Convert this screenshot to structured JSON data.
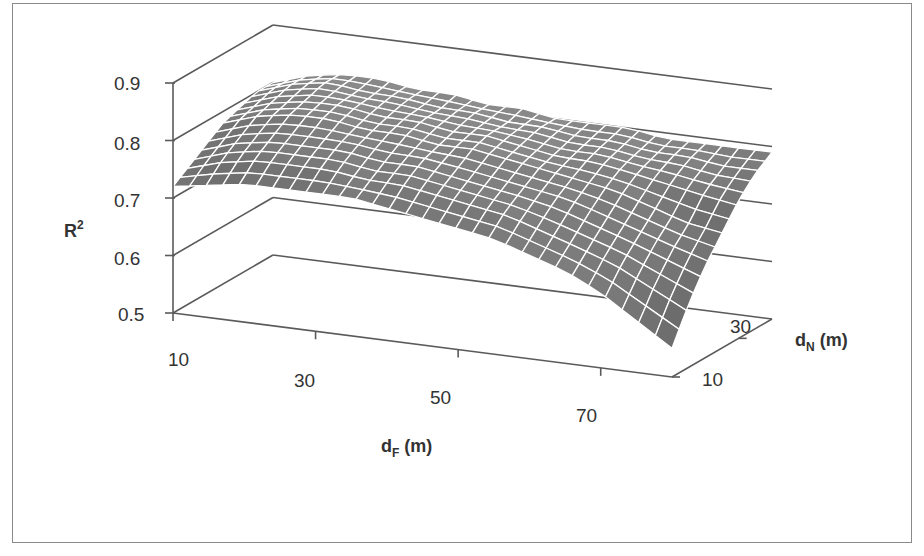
{
  "chart_data": {
    "type": "surface3d",
    "title": "",
    "xlabel": "d_F (m)",
    "xlabel_main": "d",
    "xlabel_sub": "F",
    "xlabel_unit": " (m)",
    "ylabel": "d_N (m)",
    "ylabel_main": "d",
    "ylabel_sub": "N",
    "ylabel_unit": " (m)",
    "zlabel": "R^2",
    "zlabel_main": "R",
    "zlabel_sup": "2",
    "x_ticks": [
      "10",
      "30",
      "50",
      "70"
    ],
    "y_ticks": [
      "10",
      "30"
    ],
    "z_ticks": [
      "0.5",
      "0.6",
      "0.7",
      "0.8",
      "0.9"
    ],
    "xlim": [
      10,
      80
    ],
    "ylim": [
      10,
      40
    ],
    "zlim": [
      0.5,
      0.9
    ],
    "x": [
      10,
      15,
      20,
      25,
      30,
      35,
      40,
      45,
      50,
      55,
      60,
      65,
      70,
      75,
      80
    ],
    "y": [
      10,
      15,
      20,
      25,
      30,
      35,
      40
    ],
    "z_note": "Approximate R^2 surface: peaks ~0.83 near low d_F / high d_N, ~0.72 along low d_F front edge, falls to ~0.55 at high d_F / low d_N.",
    "z": [
      [
        0.72,
        0.73,
        0.74,
        0.74,
        0.74,
        0.74,
        0.73,
        0.72,
        0.71,
        0.7,
        0.68,
        0.66,
        0.63,
        0.59,
        0.55
      ],
      [
        0.74,
        0.76,
        0.77,
        0.77,
        0.77,
        0.76,
        0.76,
        0.75,
        0.74,
        0.73,
        0.71,
        0.69,
        0.67,
        0.64,
        0.61
      ],
      [
        0.76,
        0.78,
        0.79,
        0.79,
        0.79,
        0.78,
        0.78,
        0.77,
        0.76,
        0.75,
        0.74,
        0.72,
        0.7,
        0.68,
        0.66
      ],
      [
        0.78,
        0.8,
        0.81,
        0.81,
        0.8,
        0.8,
        0.79,
        0.79,
        0.78,
        0.77,
        0.76,
        0.75,
        0.73,
        0.71,
        0.7
      ],
      [
        0.79,
        0.81,
        0.82,
        0.82,
        0.81,
        0.81,
        0.8,
        0.8,
        0.79,
        0.78,
        0.78,
        0.77,
        0.76,
        0.75,
        0.74
      ],
      [
        0.8,
        0.82,
        0.83,
        0.82,
        0.82,
        0.81,
        0.81,
        0.8,
        0.8,
        0.79,
        0.79,
        0.78,
        0.78,
        0.77,
        0.77
      ],
      [
        0.8,
        0.82,
        0.83,
        0.83,
        0.82,
        0.82,
        0.81,
        0.81,
        0.8,
        0.8,
        0.8,
        0.79,
        0.79,
        0.79,
        0.79
      ]
    ],
    "grid": true,
    "legend": "none",
    "colormap": "grayscale"
  },
  "colors": {
    "frame_border": "#8a8a8a",
    "axis_line": "#5a5a5a",
    "text": "#333333",
    "mesh_line": "#ffffff"
  }
}
